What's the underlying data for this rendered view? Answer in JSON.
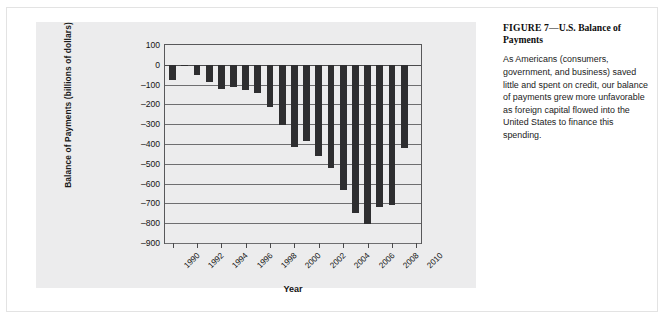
{
  "figure": {
    "caption_title_bold": "FIGURE 7",
    "caption_title_rest": "—U.S. Balance of Payments",
    "caption_body": "As Americans (consumers, government, and business) saved little and spent on credit, our balance of payments grew more unfavorable as foreign capital flowed into the United States to finance this spending."
  },
  "colors": {
    "bar": "#2e2e30",
    "plate": "#ececed",
    "grid": "#6e6e70",
    "axis": "#58585a",
    "text": "#141414"
  },
  "chart_data": {
    "type": "bar",
    "title": "",
    "xlabel": "Year",
    "ylabel": "Balance of Payments (billions of dollars)",
    "ylim": [
      -900,
      100
    ],
    "ytick_step": 100,
    "yticks": [
      100,
      0,
      -100,
      -200,
      -300,
      -400,
      -500,
      -600,
      -700,
      -800,
      -900
    ],
    "ytick_labels": [
      "100",
      "0",
      "–100",
      "–200",
      "–300",
      "–400",
      "–500",
      "–600",
      "–700",
      "–800",
      "–900"
    ],
    "xtick_labels": [
      "1990",
      "1992",
      "1994",
      "1996",
      "1998",
      "2000",
      "2002",
      "2004",
      "2006",
      "2008",
      "2010"
    ],
    "grid": true,
    "legend": "none",
    "categories": [
      1990,
      1991,
      1992,
      1993,
      1994,
      1995,
      1996,
      1997,
      1998,
      1999,
      2000,
      2001,
      2002,
      2003,
      2004,
      2005,
      2006,
      2007,
      2008,
      2009
    ],
    "values": [
      -79,
      -3,
      -51,
      -85,
      -122,
      -114,
      -125,
      -141,
      -215,
      -302,
      -417,
      -385,
      -459,
      -522,
      -631,
      -749,
      -804,
      -719,
      -706,
      -419
    ],
    "units": "billions of dollars"
  }
}
